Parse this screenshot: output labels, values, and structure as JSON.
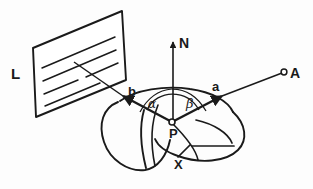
{
  "figure": {
    "kind": "technical-line-diagram",
    "stroke_color": "#1a1a1a",
    "background_color": "#fdfdfd"
  },
  "labels": {
    "light_source_plane": "L",
    "normal_vector": "N",
    "viewpoint": "A",
    "view_vector": "a",
    "illumination_vector": "b",
    "surface_point": "P",
    "surface": "X",
    "angle_incidence": "α",
    "angle_reflection": "β"
  },
  "elements": {
    "plane_L": {
      "name": "light source plane",
      "hatch_line_count": 4,
      "corners": "parallelogram"
    },
    "vector_N": {
      "name": "surface normal",
      "direction": "up",
      "origin": "P"
    },
    "vector_a": {
      "name": "direction to viewpoint A",
      "origin": "P",
      "arrow": "at P end"
    },
    "vector_b": {
      "name": "direction to light plane L",
      "origin": "P",
      "arrow": "at L end"
    },
    "point_A": {
      "name": "viewpoint marker",
      "marker": "open-circle"
    },
    "point_P": {
      "name": "surface point marker",
      "marker": "open-circle"
    },
    "surface_X": {
      "name": "curved surface patch",
      "shading": "outline only"
    }
  }
}
